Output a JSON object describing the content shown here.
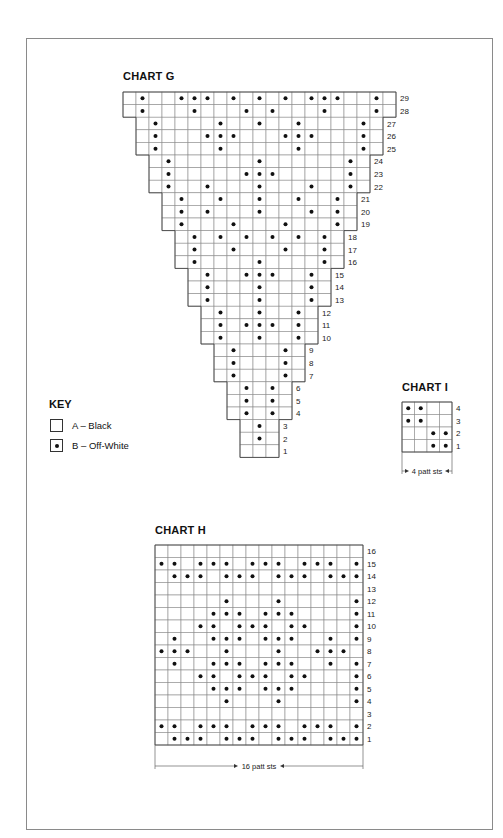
{
  "charts": {
    "g": {
      "title": "CHART G",
      "origin_x": 123,
      "origin_y": 92,
      "cell_w": 13,
      "cell_h": 12.6,
      "rows": [
        {
          "num": "29",
          "start": 0,
          "end": 20,
          "dots": [
            1,
            4,
            5,
            6,
            8,
            10,
            12,
            14,
            15,
            16,
            19
          ]
        },
        {
          "num": "28",
          "start": 0,
          "end": 20,
          "dots": [
            1,
            5,
            9,
            11,
            15,
            19
          ]
        },
        {
          "num": "27",
          "start": 1,
          "end": 19,
          "dots": [
            2,
            7,
            10,
            13,
            18
          ]
        },
        {
          "num": "26",
          "start": 1,
          "end": 19,
          "dots": [
            2,
            6,
            7,
            8,
            12,
            13,
            14,
            18
          ]
        },
        {
          "num": "25",
          "start": 1,
          "end": 19,
          "dots": [
            2,
            7,
            13,
            18
          ]
        },
        {
          "num": "24",
          "start": 2,
          "end": 18,
          "dots": [
            3,
            10,
            17
          ]
        },
        {
          "num": "23",
          "start": 2,
          "end": 18,
          "dots": [
            3,
            9,
            10,
            11,
            17
          ]
        },
        {
          "num": "22",
          "start": 2,
          "end": 18,
          "dots": [
            3,
            6,
            10,
            14,
            17
          ]
        },
        {
          "num": "21",
          "start": 3,
          "end": 17,
          "dots": [
            4,
            7,
            10,
            13,
            16
          ]
        },
        {
          "num": "20",
          "start": 3,
          "end": 17,
          "dots": [
            4,
            6,
            10,
            14,
            16
          ]
        },
        {
          "num": "19",
          "start": 3,
          "end": 17,
          "dots": [
            4,
            8,
            12,
            16
          ]
        },
        {
          "num": "18",
          "start": 4,
          "end": 16,
          "dots": [
            5,
            7,
            9,
            11,
            13,
            15
          ]
        },
        {
          "num": "17",
          "start": 4,
          "end": 16,
          "dots": [
            5,
            8,
            12,
            15
          ]
        },
        {
          "num": "16",
          "start": 4,
          "end": 16,
          "dots": [
            5,
            10,
            15
          ]
        },
        {
          "num": "15",
          "start": 5,
          "end": 15,
          "dots": [
            6,
            9,
            10,
            11,
            14
          ]
        },
        {
          "num": "14",
          "start": 5,
          "end": 15,
          "dots": [
            6,
            10,
            14
          ]
        },
        {
          "num": "13",
          "start": 5,
          "end": 15,
          "dots": [
            6,
            10,
            14
          ]
        },
        {
          "num": "12",
          "start": 6,
          "end": 14,
          "dots": [
            7,
            10,
            13
          ]
        },
        {
          "num": "11",
          "start": 6,
          "end": 14,
          "dots": [
            7,
            9,
            10,
            11,
            13
          ]
        },
        {
          "num": "10",
          "start": 6,
          "end": 14,
          "dots": [
            7,
            10,
            13
          ]
        },
        {
          "num": "9",
          "start": 7,
          "end": 13,
          "dots": [
            8,
            12
          ]
        },
        {
          "num": "8",
          "start": 7,
          "end": 13,
          "dots": [
            8,
            12
          ]
        },
        {
          "num": "7",
          "start": 7,
          "end": 13,
          "dots": [
            8,
            12
          ]
        },
        {
          "num": "6",
          "start": 8,
          "end": 12,
          "dots": [
            9,
            11
          ]
        },
        {
          "num": "5",
          "start": 8,
          "end": 12,
          "dots": [
            9,
            11
          ]
        },
        {
          "num": "4",
          "start": 8,
          "end": 12,
          "dots": [
            9,
            11
          ]
        },
        {
          "num": "3",
          "start": 9,
          "end": 11,
          "dots": [
            10
          ]
        },
        {
          "num": "2",
          "start": 9,
          "end": 11,
          "dots": [
            10
          ]
        },
        {
          "num": "1",
          "start": 9,
          "end": 11,
          "dots": []
        }
      ]
    },
    "i": {
      "title": "CHART I",
      "origin_x": 402,
      "origin_y": 402,
      "cell_w": 12.5,
      "cell_h": 12.5,
      "rows": [
        {
          "num": "4",
          "start": 0,
          "end": 3,
          "dots": [
            0,
            1
          ]
        },
        {
          "num": "3",
          "start": 0,
          "end": 3,
          "dots": [
            0,
            1
          ]
        },
        {
          "num": "2",
          "start": 0,
          "end": 3,
          "dots": [
            2,
            3
          ]
        },
        {
          "num": "1",
          "start": 0,
          "end": 3,
          "dots": [
            2,
            3
          ]
        }
      ],
      "bracket_label": "4 patt sts"
    },
    "h": {
      "title": "CHART H",
      "origin_x": 155,
      "origin_y": 545,
      "cell_w": 13,
      "cell_h": 12.5,
      "rows": [
        {
          "num": "16",
          "start": 0,
          "end": 15,
          "dots": []
        },
        {
          "num": "15",
          "start": 0,
          "end": 15,
          "dots": [
            0,
            1,
            3,
            4,
            5,
            7,
            8,
            9,
            11,
            12,
            13,
            15
          ]
        },
        {
          "num": "14",
          "start": 0,
          "end": 15,
          "dots": [
            1,
            2,
            3,
            5,
            6,
            7,
            9,
            10,
            11,
            13,
            14,
            15
          ]
        },
        {
          "num": "13",
          "start": 0,
          "end": 15,
          "dots": []
        },
        {
          "num": "12",
          "start": 0,
          "end": 15,
          "dots": [
            5,
            9,
            15
          ]
        },
        {
          "num": "11",
          "start": 0,
          "end": 15,
          "dots": [
            4,
            5,
            6,
            8,
            9,
            10,
            15
          ]
        },
        {
          "num": "10",
          "start": 0,
          "end": 15,
          "dots": [
            3,
            4,
            6,
            7,
            8,
            10,
            11,
            15
          ]
        },
        {
          "num": "9",
          "start": 0,
          "end": 15,
          "dots": [
            1,
            4,
            5,
            6,
            8,
            9,
            10,
            13,
            15
          ]
        },
        {
          "num": "8",
          "start": 0,
          "end": 15,
          "dots": [
            0,
            1,
            2,
            5,
            9,
            12,
            13,
            14
          ]
        },
        {
          "num": "7",
          "start": 0,
          "end": 15,
          "dots": [
            1,
            4,
            5,
            6,
            8,
            9,
            10,
            13,
            15
          ]
        },
        {
          "num": "6",
          "start": 0,
          "end": 15,
          "dots": [
            3,
            4,
            6,
            7,
            8,
            10,
            11,
            15
          ]
        },
        {
          "num": "5",
          "start": 0,
          "end": 15,
          "dots": [
            4,
            5,
            6,
            8,
            9,
            10,
            15
          ]
        },
        {
          "num": "4",
          "start": 0,
          "end": 15,
          "dots": [
            5,
            9,
            15
          ]
        },
        {
          "num": "3",
          "start": 0,
          "end": 15,
          "dots": []
        },
        {
          "num": "2",
          "start": 0,
          "end": 15,
          "dots": [
            0,
            1,
            3,
            4,
            5,
            7,
            8,
            9,
            11,
            12,
            13,
            15
          ]
        },
        {
          "num": "1",
          "start": 0,
          "end": 15,
          "dots": [
            1,
            2,
            3,
            5,
            6,
            7,
            9,
            10,
            11,
            13,
            14,
            15
          ]
        }
      ],
      "bracket_label": "16 patt sts"
    }
  },
  "key": {
    "title": "KEY",
    "items": [
      {
        "symbol": "empty-square",
        "label": "A – Black"
      },
      {
        "symbol": "dot-square",
        "label": "B – Off-White"
      }
    ]
  },
  "colors": {
    "grid_line": "#8c8c8c",
    "outline": "#444444",
    "dot": "#111111",
    "frame": "#8a8a8a"
  }
}
